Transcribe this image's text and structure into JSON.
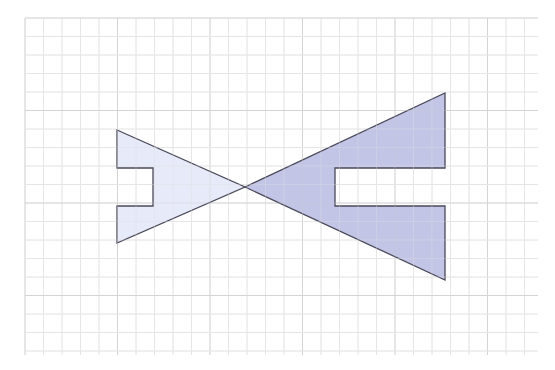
{
  "diagram": {
    "type": "geometry-reflection-on-grid",
    "grid": {
      "x0": 25,
      "y0": 18,
      "x1": 538,
      "y1": 355,
      "cell": 18.5,
      "major_every": 5,
      "minor_color": "#e6e6e6",
      "major_color": "#d4d4d4"
    },
    "shapes": [
      {
        "name": "small-shape",
        "fill": "#e3e6f7",
        "stroke": "#4a4a5a",
        "points": [
          [
            117,
            130
          ],
          [
            245,
            187
          ],
          [
            117,
            243
          ],
          [
            117,
            206
          ],
          [
            153,
            206
          ],
          [
            153,
            168
          ],
          [
            117,
            168
          ]
        ]
      },
      {
        "name": "large-shape",
        "fill": "#b9bbe3",
        "stroke": "#4a4a5a",
        "points": [
          [
            245,
            187
          ],
          [
            445,
            93
          ],
          [
            445,
            168
          ],
          [
            335,
            168
          ],
          [
            335,
            206
          ],
          [
            445,
            206
          ],
          [
            445,
            280
          ]
        ]
      }
    ],
    "center_point": [
      245,
      187
    ]
  }
}
